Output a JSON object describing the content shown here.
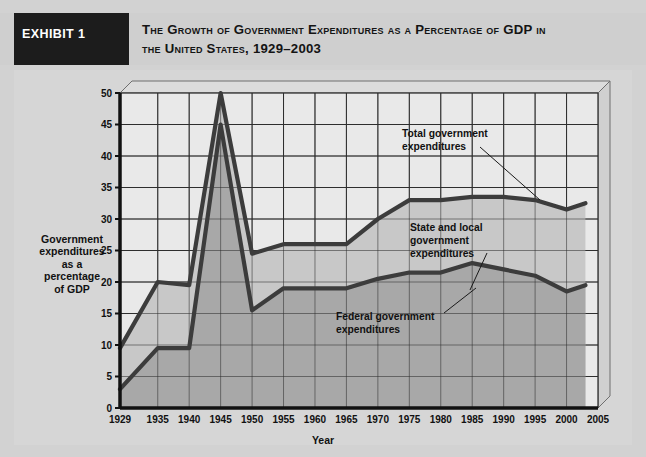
{
  "header": {
    "exhibit_label": "EXHIBIT 1",
    "title_line1": "The Growth of Government Expenditures as a Percentage of GDP in",
    "title_line2": "the United States, 1929–2003",
    "box_color": "#1c1c1c",
    "band_color": "#cfcfcf"
  },
  "chart_data": {
    "type": "area",
    "xlabel": "Year",
    "ylabel": "Government expenditures as a percentage of GDP",
    "ylabel_lines": [
      "Government",
      "expenditures",
      "as a",
      "percentage",
      "of GDP"
    ],
    "grid": true,
    "legend_position": "inline-annotations",
    "ylim": [
      0,
      50
    ],
    "yticks": [
      0,
      5,
      10,
      15,
      20,
      25,
      30,
      35,
      40,
      45,
      50
    ],
    "xlim": [
      1929,
      2005
    ],
    "xticks": [
      1929,
      1935,
      1940,
      1945,
      1950,
      1955,
      1960,
      1965,
      1970,
      1975,
      1980,
      1985,
      1990,
      1995,
      2000,
      2005
    ],
    "x": [
      1929,
      1935,
      1940,
      1945,
      1950,
      1955,
      1960,
      1965,
      1970,
      1975,
      1980,
      1985,
      1990,
      1995,
      2000,
      2003
    ],
    "series": [
      {
        "name": "Total government expenditures",
        "values": [
          9.5,
          20.0,
          19.5,
          50.0,
          24.5,
          26.0,
          26.0,
          26.0,
          30.0,
          33.0,
          33.0,
          33.5,
          33.5,
          33.0,
          31.5,
          32.5
        ],
        "line_color": "#3c3c3c",
        "fill_color": "#c8c8c8"
      },
      {
        "name": "Federal government expenditures",
        "values": [
          3.0,
          9.5,
          9.5,
          45.0,
          15.5,
          19.0,
          19.0,
          19.0,
          20.5,
          21.5,
          21.5,
          23.0,
          22.0,
          21.0,
          18.5,
          19.5
        ],
        "line_color": "#3c3c3c",
        "fill_color": "#a8a8a8"
      }
    ],
    "annotations": [
      {
        "id": "total-government-expenditures",
        "lines": [
          "Total government",
          "expenditures"
        ],
        "text": "Total government expenditures"
      },
      {
        "id": "state-and-local-government-expenditures",
        "lines": [
          "State and local",
          "government",
          "expenditures"
        ],
        "text": "State and local government expenditures"
      },
      {
        "id": "federal-government-expenditures",
        "lines": [
          "Federal government",
          "expenditures"
        ],
        "text": "Federal government expenditures"
      }
    ]
  },
  "colors": {
    "page_background": "#d2d2d2",
    "panel_background": "#d6d6d6",
    "plot_background": "#e9e9e9",
    "grid_color": "#2e2e2e",
    "axis_color": "#111111"
  }
}
